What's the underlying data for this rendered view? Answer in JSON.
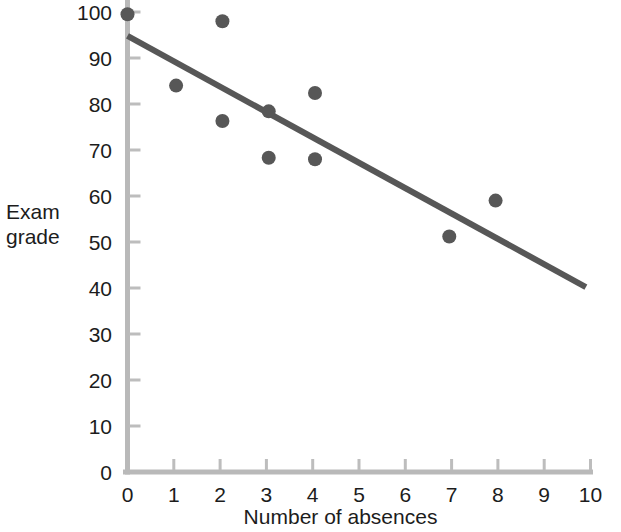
{
  "chart_data": {
    "type": "scatter",
    "title": "",
    "subtitle": "",
    "xlabel": "Number of absences",
    "ylabel": "Exam grade",
    "ylabel_lines": [
      "Exam",
      "grade"
    ],
    "xlim": [
      0,
      10
    ],
    "ylim": [
      0,
      100
    ],
    "x_ticks": [
      0,
      1,
      2,
      3,
      4,
      5,
      6,
      7,
      8,
      9,
      10
    ],
    "y_ticks": [
      0,
      10,
      20,
      30,
      40,
      50,
      60,
      70,
      80,
      90,
      100
    ],
    "x_tick_labels": [
      "0",
      "1",
      "2",
      "3",
      "4",
      "5",
      "6",
      "7",
      "8",
      "9",
      "10"
    ],
    "y_tick_labels": [
      "0",
      "10",
      "20",
      "30",
      "40",
      "50",
      "60",
      "70",
      "80",
      "90",
      "100"
    ],
    "grid": false,
    "tick_direction": "in",
    "legend": null,
    "legend_position": "none",
    "points": [
      {
        "x": 0.0,
        "y": 99.5
      },
      {
        "x": 1.05,
        "y": 84.0
      },
      {
        "x": 2.05,
        "y": 98.0
      },
      {
        "x": 2.05,
        "y": 76.3
      },
      {
        "x": 3.05,
        "y": 78.4
      },
      {
        "x": 3.05,
        "y": 68.3
      },
      {
        "x": 4.05,
        "y": 82.4
      },
      {
        "x": 4.05,
        "y": 68.0
      },
      {
        "x": 6.95,
        "y": 51.2
      },
      {
        "x": 7.95,
        "y": 59.0
      }
    ],
    "trend_line": {
      "type": "linear-fit",
      "x_start": 0.0,
      "y_start": 94.8,
      "x_end": 9.9,
      "y_end": 40.2,
      "slope": -5.515,
      "intercept": 94.8
    },
    "colors": {
      "point": "#575757",
      "trend_line": "#575757",
      "axis": "#b9b9b9",
      "tick": "#bdbdbd",
      "text": "#1c1c1c",
      "background": "#ffffff"
    },
    "style": {
      "point_radius": 7,
      "trend_line_width": 6,
      "axis_width": 5,
      "tick_length": 11,
      "tick_width": 3
    },
    "geometry": {
      "x0_px": 127.5,
      "y0_px": 472.0,
      "x_unit_px": 46.3,
      "y_unit_px": 4.6
    }
  }
}
